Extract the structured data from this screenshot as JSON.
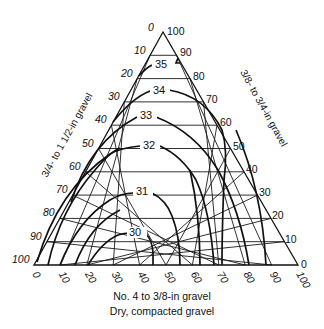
{
  "diagram": {
    "type": "ternary",
    "left_axis_label": "3/4- to 1 1/2-in gravel",
    "right_axis_label": "3/8- to 3/4-in gravel",
    "bottom_axis_label": "No. 4 to 3/8-in gravel",
    "subtitle": "Dry, compacted gravel",
    "left_ticks": [
      "0",
      "10",
      "20",
      "30",
      "40",
      "50",
      "60",
      "70",
      "80",
      "90",
      "100"
    ],
    "right_ticks": [
      "100",
      "90",
      "80",
      "70",
      "60",
      "50",
      "40",
      "30",
      "20",
      "10",
      "0"
    ],
    "bottom_ticks": [
      "0",
      "10",
      "20",
      "30",
      "40",
      "50",
      "60",
      "70",
      "80",
      "90",
      "100"
    ],
    "contour_labels": [
      "35",
      "34",
      "33",
      "32",
      "31",
      "30"
    ],
    "colors": {
      "ink": "#111111",
      "background": "#ffffff"
    }
  },
  "chart_data": {
    "type": "ternary-contour",
    "title": "Dry, compacted gravel",
    "axes": {
      "left": "3/4- to 1 1/2-in gravel (%)",
      "right": "3/8- to 3/4-in gravel (%)",
      "bottom": "No. 4 to 3/8-in gravel (%)"
    },
    "axis_range": [
      0,
      100
    ],
    "tick_step": 10,
    "grid": true,
    "contours": [
      {
        "value": 35,
        "label": "35"
      },
      {
        "value": 34,
        "label": "34"
      },
      {
        "value": 33,
        "label": "33"
      },
      {
        "value": 32,
        "label": "32"
      },
      {
        "value": 31,
        "label": "31"
      },
      {
        "value": 30,
        "label": "30"
      }
    ]
  }
}
